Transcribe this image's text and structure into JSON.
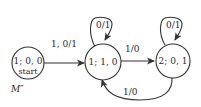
{
  "diagram": {
    "type": "finite-state-machine",
    "label": "M″",
    "states": [
      {
        "id": "s1",
        "label": "1; 0, 0",
        "sublabel": "start"
      },
      {
        "id": "s2",
        "label": "1; 1, 0"
      },
      {
        "id": "s3",
        "label": "2; 0, 1"
      }
    ],
    "transitions": [
      {
        "from": "s1",
        "to": "s2",
        "label": "1, 0/1"
      },
      {
        "from": "s2",
        "to": "s2",
        "label": "0/1"
      },
      {
        "from": "s2",
        "to": "s3",
        "label": "1/0"
      },
      {
        "from": "s3",
        "to": "s3",
        "label": "0/1"
      },
      {
        "from": "s3",
        "to": "s2",
        "label": "1/0"
      }
    ]
  }
}
